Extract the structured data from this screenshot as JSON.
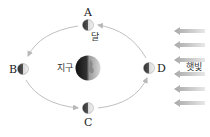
{
  "diagram": {
    "type": "moon-phases",
    "moon_positions": [
      {
        "id": "A",
        "label": "A",
        "x": 88,
        "y": 25
      },
      {
        "id": "B",
        "label": "B",
        "x": 23,
        "y": 69
      },
      {
        "id": "C",
        "label": "C",
        "x": 88,
        "y": 108
      },
      {
        "id": "D",
        "label": "D",
        "x": 149,
        "y": 68
      }
    ],
    "moon_label": "달",
    "earth_label": "지구",
    "sunlight_label": "햇빛",
    "arrow_count": 6,
    "colors": {
      "orbit": "#b8b8b8",
      "arrow": "#b0b0b0",
      "moon_dark": "#3a3a3a",
      "moon_light": "#e8e8e8",
      "text": "#222222"
    }
  }
}
